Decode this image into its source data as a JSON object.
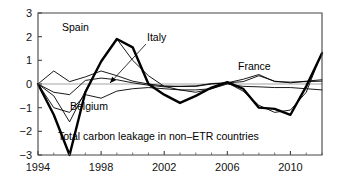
{
  "chart_data": {
    "type": "line",
    "title": "",
    "subtitle": "",
    "xlabel": "",
    "ylabel": "",
    "xlim": [
      1994,
      2012
    ],
    "ylim": [
      -3,
      3
    ],
    "yticks": [
      "3",
      "2",
      "1",
      "0",
      "-1",
      "-2",
      "-3"
    ],
    "ytick_values": [
      3,
      2,
      1,
      0,
      -1,
      -2,
      -3
    ],
    "xticks": [
      "1994",
      "1998",
      "2002",
      "2006",
      "2010"
    ],
    "xtick_values": [
      1994,
      1998,
      2002,
      2006,
      2010
    ],
    "minor_xticks": [
      1995,
      1996,
      1997,
      1999,
      2000,
      2001,
      2003,
      2004,
      2005,
      2007,
      2008,
      2009,
      2011,
      2012
    ],
    "grid": false,
    "legend_position": "inline-annotations",
    "zero_reference_line": true,
    "x": [
      1994,
      1995,
      1996,
      1997,
      1998,
      1999,
      2000,
      2001,
      2002,
      2003,
      2004,
      2005,
      2006,
      2007,
      2008,
      2009,
      2010,
      2011,
      2012
    ],
    "series": [
      {
        "name": "Total carbon leakage in non-ETR countries",
        "style": "thick",
        "values": [
          0.0,
          -1.3,
          -3.0,
          -0.35,
          0.95,
          1.9,
          1.55,
          0.0,
          -0.45,
          -0.8,
          -0.5,
          -0.15,
          0.08,
          -0.2,
          -1.0,
          -1.05,
          -1.3,
          -0.1,
          1.3
        ]
      },
      {
        "name": "Spain",
        "style": "thin",
        "values": [
          0.0,
          -0.5,
          -1.6,
          -0.3,
          0.95,
          1.9,
          1.0,
          0.35,
          -0.1,
          -0.25,
          -0.35,
          -0.2,
          0.05,
          -0.3,
          -0.9,
          -1.2,
          -1.1,
          -0.35,
          1.35
        ]
      },
      {
        "name": "Italy",
        "style": "thin",
        "values": [
          0.0,
          0.55,
          0.1,
          0.3,
          0.55,
          0.35,
          0.12,
          0.0,
          -0.08,
          -0.1,
          -0.1,
          0.0,
          0.05,
          0.1,
          0.35,
          0.12,
          0.05,
          0.12,
          0.18
        ]
      },
      {
        "name": "Belgium",
        "style": "thin",
        "values": [
          0.0,
          -1.0,
          -1.2,
          -0.45,
          -0.6,
          -0.3,
          -0.2,
          -0.15,
          -0.2,
          -0.25,
          -0.25,
          -0.2,
          0.0,
          -0.1,
          -0.12,
          -0.15,
          -0.15,
          -0.2,
          -0.25
        ]
      },
      {
        "name": "France",
        "style": "thin",
        "values": [
          0.0,
          -0.35,
          -0.45,
          0.15,
          0.25,
          0.18,
          0.05,
          -0.05,
          -0.12,
          -0.1,
          -0.08,
          0.02,
          0.05,
          0.2,
          0.4,
          0.1,
          0.08,
          0.1,
          0.12
        ]
      }
    ],
    "annotations": [
      {
        "text": "Spain",
        "x": 62,
        "y": 31,
        "anchor": "start",
        "leader": null
      },
      {
        "text": "Italy",
        "x": 147,
        "y": 41,
        "anchor": "start",
        "leader": {
          "x1": 146,
          "y1": 44,
          "x2": 110,
          "y2": 83,
          "arrow": true
        }
      },
      {
        "text": "Belgium",
        "x": 70,
        "y": 110,
        "anchor": "start",
        "leader": null
      },
      {
        "text": "France",
        "x": 238,
        "y": 70,
        "anchor": "start",
        "leader": null
      },
      {
        "text": "Total carbon leakage in non-ETR countries",
        "x": 58,
        "y": 140,
        "anchor": "start",
        "leader": null
      }
    ],
    "colors": {
      "line": "#000000",
      "axis": "#444444",
      "zero_line": "#9a9a9a",
      "background": "#ffffff"
    }
  }
}
